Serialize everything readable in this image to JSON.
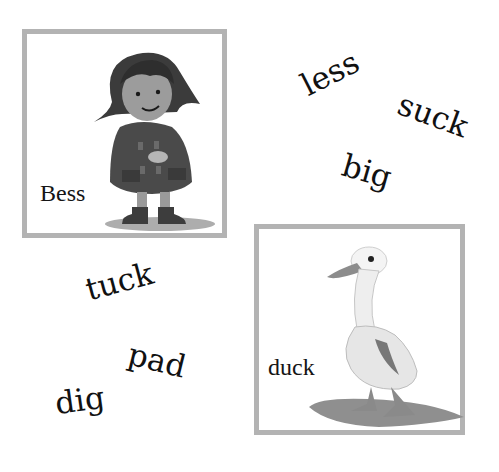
{
  "cards": [
    {
      "id": "bess",
      "label": "Bess",
      "illustration": "girl-in-coat-and-boots-illustration"
    },
    {
      "id": "duck",
      "label": "duck",
      "illustration": "white-duck-illustration"
    }
  ],
  "words": [
    {
      "text": "less",
      "rotation_deg": -27
    },
    {
      "text": "suck",
      "rotation_deg": 20
    },
    {
      "text": "big",
      "rotation_deg": 16
    },
    {
      "text": "tuck",
      "rotation_deg": -15
    },
    {
      "text": "pad",
      "rotation_deg": 14
    },
    {
      "text": "dig",
      "rotation_deg": -8
    }
  ],
  "colors": {
    "frame_border": "#b3b3b3",
    "text": "#111111",
    "background": "#ffffff"
  }
}
